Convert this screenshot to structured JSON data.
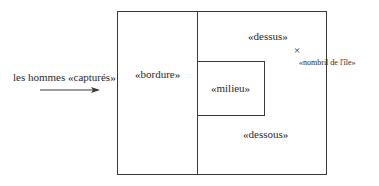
{
  "diagram": {
    "entry_label": "les hommes «capturés»",
    "regions": {
      "bordure": "«bordure»",
      "dessus": "«dessus»",
      "milieu": "«milieu»",
      "dessous": "«dessous»"
    },
    "marker": {
      "symbol": "×",
      "label": "«nombril de l'île»"
    },
    "colors": {
      "line": "#3a3a3a",
      "text": "#2a2a2a",
      "background": "#ffffff"
    }
  }
}
